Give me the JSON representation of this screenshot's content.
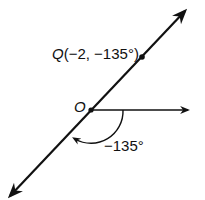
{
  "diagram": {
    "type": "polar-coordinate-plot",
    "point": {
      "name": "Q",
      "label": "Q(−2, −135°)",
      "r": -2,
      "theta_deg": -135
    },
    "origin": {
      "label": "O"
    },
    "angle": {
      "label": "−135°",
      "direction": "clockwise"
    },
    "colors": {
      "ink": "#111111",
      "background": "#ffffff"
    }
  }
}
